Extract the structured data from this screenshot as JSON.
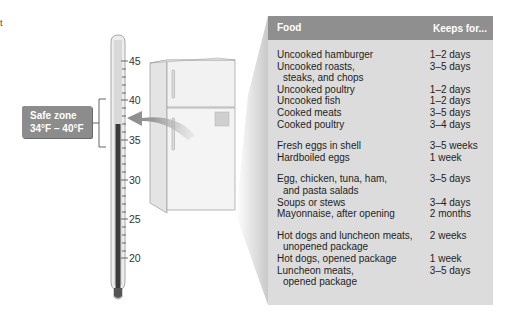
{
  "corner_mark": "t",
  "thermometer": {
    "scale_labels": [
      "45",
      "40",
      "35",
      "30",
      "25",
      "20"
    ],
    "unit": "°F",
    "mercury_color": "#3a3a3a"
  },
  "safe_zone": {
    "title": "Safe zone",
    "range": "34°F – 40°F",
    "box_color": "#8c8c8c"
  },
  "table": {
    "headers": {
      "food": "Food",
      "keeps": "Keeps for..."
    },
    "header_color": "#8f8f8f",
    "body_color": "#dcdcdc",
    "groups": [
      {
        "rows": [
          {
            "food": "Uncooked hamburger",
            "keeps": "1–2 days"
          },
          {
            "food": "Uncooked roasts,",
            "food_cont": "steaks, and chops",
            "keeps": "3–5 days"
          },
          {
            "food": "Uncooked poultry",
            "keeps": "1–2 days"
          },
          {
            "food": "Uncooked fish",
            "keeps": "1–2 days"
          },
          {
            "food": "Cooked meats",
            "keeps": "3–5 days"
          },
          {
            "food": "Cooked poultry",
            "keeps": "3–4 days"
          }
        ]
      },
      {
        "rows": [
          {
            "food": "Fresh eggs in shell",
            "keeps": "3–5 weeks"
          },
          {
            "food": "Hardboiled eggs",
            "keeps": "1 week"
          }
        ]
      },
      {
        "rows": [
          {
            "food": "Egg, chicken, tuna, ham,",
            "food_cont": "and pasta salads",
            "keeps": "3–5 days"
          },
          {
            "food": "Soups or stews",
            "keeps": "3–4 days"
          },
          {
            "food": "Mayonnaise, after opening",
            "keeps": "2 months"
          }
        ]
      },
      {
        "rows": [
          {
            "food": "Hot dogs and luncheon meats,",
            "food_cont": "unopened package",
            "keeps": "2 weeks"
          },
          {
            "food": "Hot dogs, opened package",
            "keeps": "1 week"
          },
          {
            "food": "Luncheon meats,",
            "food_cont": "opened package",
            "keeps": "3–5 days"
          }
        ]
      }
    ]
  }
}
